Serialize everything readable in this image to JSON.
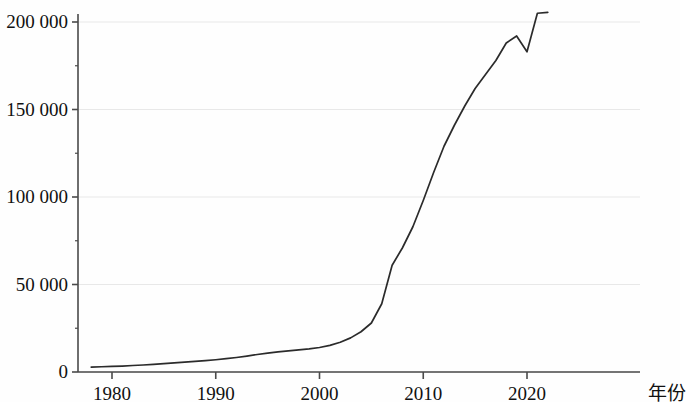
{
  "chart_data": {
    "type": "line",
    "title": "",
    "subtitle": "",
    "xlabel": "年份",
    "ylabel": "",
    "xlim": [
      1978,
      2023
    ],
    "ylim": [
      0,
      212000
    ],
    "grid": true,
    "legend": false,
    "legend_position": "none",
    "line_color": "#2b2b2b",
    "background_color": "#fefefe",
    "grid_color": "#e8e8e8",
    "axis_color": "#4a4a4a",
    "y_ticks": [
      0,
      50000,
      100000,
      150000,
      200000
    ],
    "y_tick_labels": [
      "0",
      "50 000",
      "100 000",
      "150 000",
      "200 000"
    ],
    "x_ticks": [
      1980,
      1990,
      2000,
      2010,
      2020
    ],
    "x_tick_labels": [
      "1980",
      "1990",
      "2000",
      "2010",
      "2020"
    ],
    "x": [
      1978,
      1979,
      1980,
      1981,
      1982,
      1983,
      1984,
      1985,
      1986,
      1987,
      1988,
      1989,
      1990,
      1991,
      1992,
      1993,
      1994,
      1995,
      1996,
      1997,
      1998,
      1999,
      2000,
      2001,
      2002,
      2003,
      2004,
      2005,
      2006,
      2007,
      2008,
      2009,
      2010,
      2011,
      2012,
      2013,
      2014,
      2015,
      2016,
      2017,
      2018,
      2019,
      2020,
      2021,
      2022
    ],
    "values": [
      2800,
      3000,
      3200,
      3400,
      3700,
      4000,
      4400,
      4800,
      5200,
      5600,
      6100,
      6500,
      7000,
      7600,
      8300,
      9100,
      10000,
      10800,
      11500,
      12100,
      12600,
      13200,
      14000,
      15200,
      17000,
      19500,
      23000,
      28000,
      39000,
      61000,
      71000,
      83000,
      98000,
      114000,
      129000,
      141000,
      152000,
      162000,
      170000,
      178000,
      188000,
      192000,
      183000,
      205000,
      205500
    ],
    "series": [
      {
        "name": "",
        "values": [
          2800,
          3000,
          3200,
          3400,
          3700,
          4000,
          4400,
          4800,
          5200,
          5600,
          6100,
          6500,
          7000,
          7600,
          8300,
          9100,
          10000,
          10800,
          11500,
          12100,
          12600,
          13200,
          14000,
          15200,
          17000,
          19500,
          23000,
          28000,
          39000,
          61000,
          71000,
          83000,
          98000,
          114000,
          129000,
          141000,
          152000,
          162000,
          170000,
          178000,
          188000,
          192000,
          183000,
          205000,
          205500
        ]
      }
    ],
    "annotations": []
  }
}
